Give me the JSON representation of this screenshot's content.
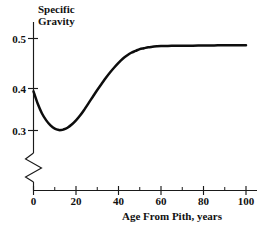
{
  "chart_data": {
    "type": "line",
    "title": "Specific Gravity",
    "title_line1": "Specific",
    "title_line2": "Gravity",
    "xlabel": "Age From Pith, years",
    "ylabel": "Specific Gravity",
    "xlim": [
      0,
      105
    ],
    "ylim": [
      0.285,
      0.515
    ],
    "grid": false,
    "legend": null,
    "y_axis_break": true,
    "y_axis_break_note": "zigzag break between 0 and the start of the value scale",
    "xticks": [
      0,
      20,
      40,
      60,
      80,
      100
    ],
    "xtick_labels": [
      "0",
      "20",
      "40",
      "60",
      "80",
      "100"
    ],
    "xticks_minor": [
      10,
      30,
      50,
      70,
      90
    ],
    "yticks": [
      0.3,
      0.4,
      0.5
    ],
    "ytick_labels": [
      "0.3",
      "0.4",
      "0.5"
    ],
    "origin_label": "0",
    "series": [
      {
        "name": "Specific Gravity",
        "color": "#0d0d0d",
        "x": [
          0,
          2,
          4,
          6,
          8,
          10,
          12,
          13,
          14,
          16,
          18,
          20,
          22,
          24,
          26,
          28,
          30,
          32,
          34,
          36,
          38,
          40,
          42,
          44,
          46,
          48,
          50,
          52,
          54,
          56,
          58,
          60,
          65,
          70,
          75,
          80,
          85,
          90,
          95,
          100
        ],
        "y": [
          0.385,
          0.358,
          0.337,
          0.322,
          0.311,
          0.304,
          0.301,
          0.301,
          0.302,
          0.306,
          0.313,
          0.322,
          0.333,
          0.346,
          0.36,
          0.374,
          0.388,
          0.401,
          0.414,
          0.426,
          0.437,
          0.447,
          0.456,
          0.463,
          0.469,
          0.473,
          0.477,
          0.479,
          0.481,
          0.482,
          0.483,
          0.4835,
          0.484,
          0.4843,
          0.4845,
          0.4848,
          0.485,
          0.4852,
          0.4853,
          0.4855
        ]
      }
    ],
    "annotations": [
      {
        "text": "minimum near age 13 years at specific gravity 0.30"
      },
      {
        "text": "plateau near specific gravity 0.485 beyond age 60 years"
      }
    ]
  }
}
